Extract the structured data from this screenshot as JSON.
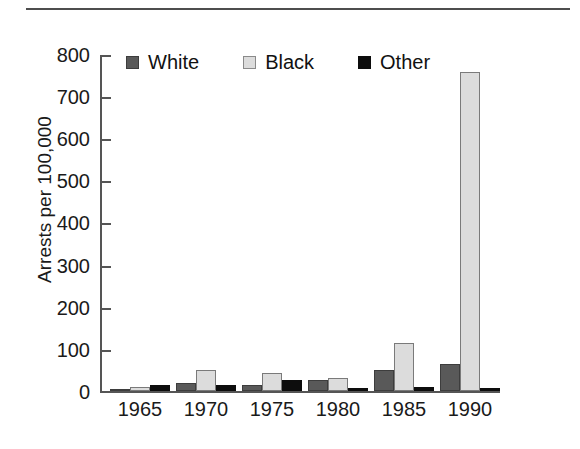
{
  "chart_data": {
    "type": "bar",
    "title": "",
    "subtitle": "",
    "xlabel": "",
    "ylabel": "Arrests per 100,000",
    "categories": [
      "1965",
      "1970",
      "1975",
      "1980",
      "1985",
      "1990"
    ],
    "series": [
      {
        "name": "White",
        "color": "#595959",
        "values": [
          5,
          20,
          15,
          25,
          50,
          65
        ]
      },
      {
        "name": "Black",
        "color": "#dcdcdc",
        "values": [
          10,
          50,
          42,
          32,
          115,
          760
        ]
      },
      {
        "name": "Other",
        "color": "#0d0d0d",
        "values": [
          14,
          14,
          25,
          8,
          10,
          8
        ]
      }
    ],
    "ylim": [
      0,
      800
    ],
    "ytick_step": 100,
    "yticks": [
      "800",
      "700",
      "600",
      "500",
      "400",
      "300",
      "200",
      "100",
      "0"
    ],
    "grid": false,
    "legend_position": "top-left-inside",
    "legend": [
      "White",
      "Black",
      "Other"
    ]
  },
  "figure": {
    "top_rule_color": "#4d4d4d",
    "axis_color": "#555555",
    "background": "#ffffff"
  }
}
